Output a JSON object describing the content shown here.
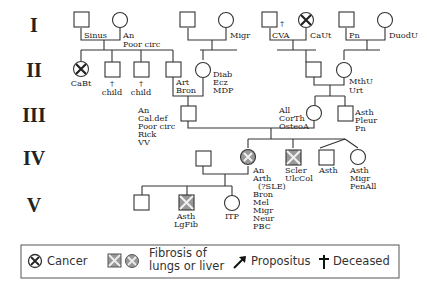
{
  "generations": [
    "I",
    "II",
    "III",
    "IV",
    "V"
  ],
  "individuals": [
    {
      "id": "I-1",
      "gen": "I",
      "sex": "male",
      "status": "unaffected",
      "labels": [
        "Sinus"
      ]
    },
    {
      "id": "I-2",
      "gen": "I",
      "sex": "female",
      "status": "unaffected",
      "labels": [
        "An",
        "Poor circ"
      ]
    },
    {
      "id": "I-3",
      "gen": "I",
      "sex": "male",
      "status": "unaffected",
      "labels": []
    },
    {
      "id": "I-4",
      "gen": "I",
      "sex": "female",
      "status": "unaffected",
      "labels": [
        "Migr"
      ]
    },
    {
      "id": "I-5",
      "gen": "I",
      "sex": "male",
      "status": "deceased",
      "labels": [
        "CVA"
      ]
    },
    {
      "id": "I-6",
      "gen": "I",
      "sex": "female",
      "status": "cancer",
      "labels": [
        "CaUt"
      ]
    },
    {
      "id": "I-7",
      "gen": "I",
      "sex": "male",
      "status": "unaffected",
      "labels": [
        "Pn"
      ]
    },
    {
      "id": "I-8",
      "gen": "I",
      "sex": "female",
      "status": "unaffected",
      "labels": [
        "DuodU"
      ]
    },
    {
      "id": "II-1",
      "gen": "II",
      "sex": "female",
      "status": "cancer",
      "labels": [
        "CaBt"
      ]
    },
    {
      "id": "II-2",
      "gen": "II",
      "sex": "male",
      "status": "deceased",
      "labels": [
        "child"
      ]
    },
    {
      "id": "II-3",
      "gen": "II",
      "sex": "male",
      "status": "deceased",
      "labels": [
        "child"
      ]
    },
    {
      "id": "II-4",
      "gen": "II",
      "sex": "male",
      "status": "unaffected",
      "labels": [
        "Art",
        "Bron"
      ]
    },
    {
      "id": "II-5",
      "gen": "II",
      "sex": "female",
      "status": "unaffected",
      "labels": [
        "Diab",
        "Ecz",
        "MDP"
      ]
    },
    {
      "id": "II-6",
      "gen": "II",
      "sex": "male",
      "status": "unaffected",
      "labels": []
    },
    {
      "id": "II-7",
      "gen": "II",
      "sex": "female",
      "status": "unaffected",
      "labels": [
        "MthU",
        "Urt"
      ]
    },
    {
      "id": "III-1",
      "gen": "III",
      "sex": "male",
      "status": "unaffected",
      "labels": [
        "An",
        "Cal.def",
        "Poor circ",
        "Rick",
        "VV"
      ]
    },
    {
      "id": "III-2",
      "gen": "III",
      "sex": "female",
      "status": "unaffected",
      "labels": [
        "All",
        "CorTh",
        "OsteoA"
      ]
    },
    {
      "id": "III-3",
      "gen": "III",
      "sex": "male",
      "status": "unaffected",
      "labels": [
        "Asth",
        "Pleur",
        "Pn"
      ]
    },
    {
      "id": "IV-1",
      "gen": "IV",
      "sex": "male",
      "status": "unaffected",
      "labels": []
    },
    {
      "id": "IV-2",
      "gen": "IV",
      "sex": "female",
      "status": "fibrosis",
      "labels": [
        "An",
        "Arth",
        "(?SLE)",
        "Bron",
        "Mel",
        "Migr",
        "Neur",
        "PBC"
      ]
    },
    {
      "id": "IV-3",
      "gen": "IV",
      "sex": "male",
      "status": "fibrosis",
      "labels": [
        "Scler",
        "UlcCol"
      ]
    },
    {
      "id": "IV-4",
      "gen": "IV",
      "sex": "male",
      "status": "unaffected",
      "twin": true,
      "labels": [
        "Asth"
      ]
    },
    {
      "id": "IV-5",
      "gen": "IV",
      "sex": "female",
      "status": "unaffected",
      "twin": true,
      "labels": [
        "Asth",
        "Migr",
        "PenAll"
      ]
    },
    {
      "id": "V-1",
      "gen": "V",
      "sex": "male",
      "status": "unaffected",
      "labels": []
    },
    {
      "id": "V-2",
      "gen": "V",
      "sex": "male",
      "status": "fibrosis",
      "labels": [
        "Asth",
        "LgFib"
      ]
    },
    {
      "id": "V-3",
      "gen": "V",
      "sex": "female",
      "status": "unaffected",
      "labels": [
        "ITP"
      ]
    }
  ],
  "legend": {
    "cancer": "Cancer",
    "fibrosis_line1": "Fibrosis of",
    "fibrosis_line2": "lungs or liver",
    "propositus": "Propositus",
    "deceased": "Deceased",
    "deceased_symbol": "†"
  }
}
